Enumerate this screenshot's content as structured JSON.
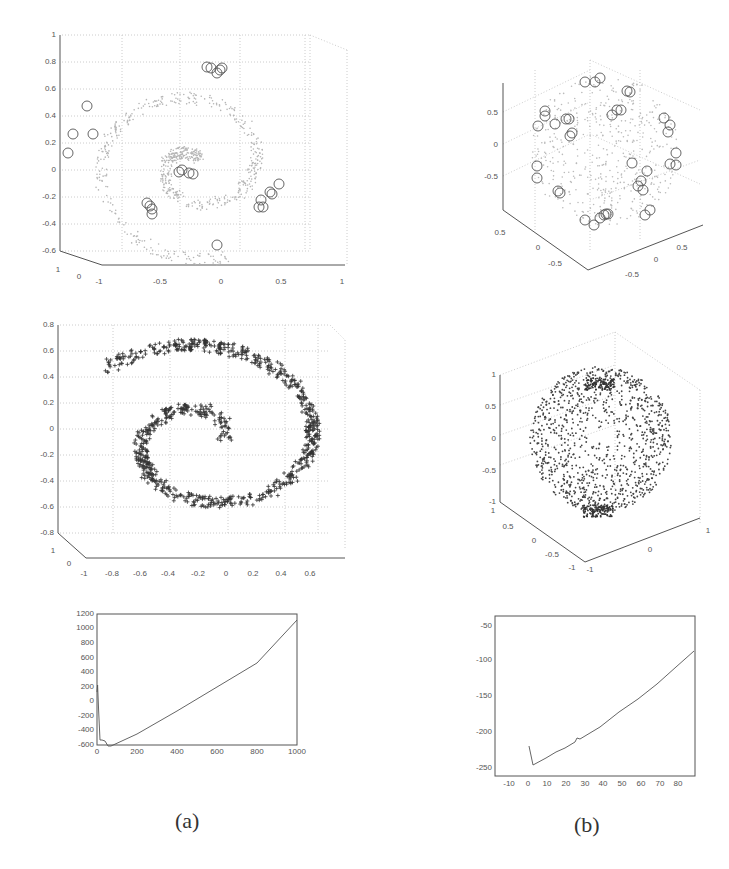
{
  "captions": {
    "a": "(a)",
    "b": "(b)"
  },
  "chart_data": [
    {
      "id": "a-top",
      "type": "scatter",
      "title": "",
      "description": "3D scatter of Swiss-roll-like spiral embedding (light dots) with circled landmark points",
      "markers": [
        "dot",
        "circle"
      ],
      "z_ticks": [
        "-0.6",
        "-0.4",
        "-0.2",
        "0",
        "0.2",
        "0.4",
        "0.6",
        "0.8",
        "1"
      ],
      "x_ticks": [
        "-1",
        "-0.5",
        "0",
        "0.5",
        "1"
      ],
      "y_ticks": [
        "1",
        "0"
      ],
      "zlim": [
        -0.6,
        1
      ],
      "xlim": [
        -1,
        1
      ],
      "grid": true,
      "circled_points": [
        [
          -0.12,
          0.76
        ],
        [
          -0.03,
          0.74
        ],
        [
          -0.78,
          0.47
        ],
        [
          -0.88,
          0.26
        ],
        [
          -0.74,
          0.26
        ],
        [
          -0.93,
          0.12
        ],
        [
          -0.33,
          -0.02
        ],
        [
          -0.24,
          -0.03
        ],
        [
          -0.57,
          -0.27
        ],
        [
          -0.55,
          -0.35
        ],
        [
          0.34,
          -0.27
        ],
        [
          0.42,
          -0.18
        ],
        [
          0.47,
          -0.11
        ],
        [
          -0.05,
          -0.57
        ]
      ]
    },
    {
      "id": "b-top",
      "type": "scatter",
      "title": "",
      "description": "3D scatter of sphere embedding (light dots) with circled landmark points",
      "markers": [
        "dot",
        "circle"
      ],
      "z_ticks": [
        "-0.5",
        "0",
        "0.5"
      ],
      "x_ticks": [
        "-0.5",
        "0",
        "0.5"
      ],
      "y_ticks": [
        "0.5",
        "0",
        "-0.5"
      ],
      "grid": true
    },
    {
      "id": "a-mid",
      "type": "scatter",
      "title": "",
      "description": "3D scatter of spiral (plus markers), recovered embedding",
      "markers": [
        "plus"
      ],
      "z_ticks": [
        "-0.8",
        "-0.6",
        "-0.4",
        "-0.2",
        "0",
        "0.2",
        "0.4",
        "0.6",
        "0.8"
      ],
      "x_ticks": [
        "-1",
        "-0.8",
        "-0.6",
        "-0.4",
        "-0.2",
        "0",
        "0.2",
        "0.4",
        "0.6"
      ],
      "y_ticks": [
        "1",
        "0"
      ],
      "zlim": [
        -0.8,
        0.8
      ],
      "xlim": [
        -1,
        0.8
      ],
      "grid": true
    },
    {
      "id": "b-mid",
      "type": "scatter",
      "title": "",
      "description": "3D scatter of points on unit sphere (dots)",
      "markers": [
        "dot"
      ],
      "z_ticks": [
        "-1",
        "-0.5",
        "0",
        "0.5",
        "1"
      ],
      "x_ticks": [
        "-1",
        "0",
        "1"
      ],
      "y_ticks": [
        "1",
        "0.5",
        "0",
        "-0.5",
        "-1"
      ],
      "zlim": [
        -1,
        1
      ],
      "grid": true
    },
    {
      "id": "a-bottom",
      "type": "line",
      "title": "",
      "xlabel": "",
      "ylabel": "",
      "x_ticks": [
        "0",
        "200",
        "400",
        "600",
        "800",
        "1000"
      ],
      "y_ticks": [
        "-800",
        "-600",
        "-400",
        "-200",
        "0",
        "200",
        "400",
        "600",
        "800",
        "1000",
        "1200"
      ],
      "xlim": [
        0,
        1000
      ],
      "ylim": [
        -800,
        1200
      ],
      "grid": false,
      "x": [
        0,
        3,
        8,
        15,
        25,
        40,
        55,
        70,
        200,
        400,
        600,
        800,
        1000
      ],
      "y": [
        150,
        250,
        -100,
        -540,
        -540,
        -560,
        -630,
        -620,
        -460,
        -140,
        180,
        500,
        1100
      ]
    },
    {
      "id": "b-bottom",
      "type": "line",
      "title": "",
      "xlabel": "",
      "ylabel": "",
      "x_ticks": [
        "-10",
        "0",
        "10",
        "20",
        "30",
        "40",
        "50",
        "60",
        "70",
        "80"
      ],
      "y_ticks": [
        "-250",
        "-200",
        "-150",
        "-100",
        "-50"
      ],
      "xlim": [
        -17,
        89
      ],
      "ylim": [
        -260,
        -40
      ],
      "grid": false,
      "x": [
        1,
        3,
        10,
        15,
        20,
        25,
        27,
        30,
        40,
        50,
        60,
        70,
        80,
        89
      ],
      "y": [
        -220,
        -247,
        -237,
        -228,
        -222,
        -215,
        -210,
        -211,
        -195,
        -176,
        -157,
        -136,
        -112,
        -89
      ]
    }
  ]
}
